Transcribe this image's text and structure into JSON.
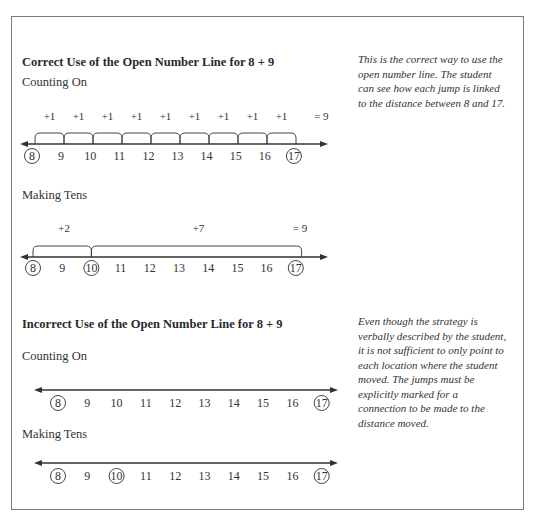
{
  "correct": {
    "title": "Correct Use of the Open Number Line for 8 + 9",
    "note": "This is the correct way to use the open number line. The student can see how each jump is linked to the distance between 8 and 17.",
    "counting_on": {
      "label": "Counting On",
      "jumps": [
        "+1",
        "+1",
        "+1",
        "+1",
        "+1",
        "+1",
        "+1",
        "+1",
        "+1"
      ],
      "total": "= 9",
      "ticks": [
        "8",
        "9",
        "10",
        "11",
        "12",
        "13",
        "14",
        "15",
        "16",
        "17"
      ],
      "circled": [
        "8",
        "17"
      ]
    },
    "making_tens": {
      "label": "Making Tens",
      "jumps": [
        "+2",
        "+7"
      ],
      "total": "= 9",
      "ticks": [
        "8",
        "9",
        "10",
        "11",
        "12",
        "13",
        "14",
        "15",
        "16",
        "17"
      ],
      "circled": [
        "8",
        "10",
        "17"
      ]
    }
  },
  "incorrect": {
    "title": "Incorrect Use of the Open Number Line for 8 + 9",
    "note": "Even though the strategy is verbally described by the student, it is not sufficient to only point to each location where the student moved. The jumps must be explicitly marked for a connection to be made to the distance moved.",
    "counting_on": {
      "label": "Counting On",
      "ticks": [
        "8",
        "9",
        "10",
        "11",
        "12",
        "13",
        "14",
        "15",
        "16",
        "17"
      ],
      "circled": [
        "8",
        "17"
      ]
    },
    "making_tens": {
      "label": "Making Tens",
      "ticks": [
        "8",
        "9",
        "10",
        "11",
        "12",
        "13",
        "14",
        "15",
        "16",
        "17"
      ],
      "circled": [
        "8",
        "10",
        "17"
      ]
    }
  }
}
